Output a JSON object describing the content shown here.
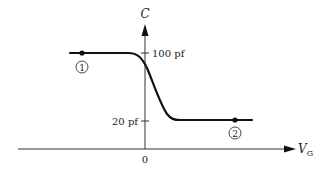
{
  "diagram": {
    "y_axis": {
      "label": "C"
    },
    "x_axis": {
      "label": "V",
      "label_subscript": "G",
      "origin_label": "0"
    },
    "ticks": [
      {
        "label": "100 pf",
        "value": 100
      },
      {
        "label": "20 pf",
        "value": 20
      }
    ],
    "points": [
      {
        "marker": "1",
        "label": "①",
        "region": "high capacitance (100 pf)"
      },
      {
        "marker": "2",
        "label": "②",
        "region": "low capacitance (20 pf)"
      }
    ],
    "colors": {
      "line": "#111111",
      "text": "#222222",
      "background": "#ffffff"
    }
  }
}
